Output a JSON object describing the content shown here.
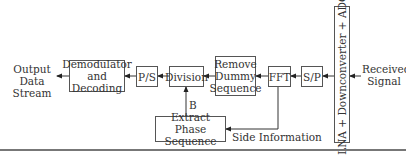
{
  "diagram": {
    "type": "block-diagram",
    "title": "",
    "blocks": {
      "demodulator": "Demodulator and Decoding",
      "ps": "P/S",
      "division": "Division",
      "remove_dummy": "Remove Dummy Sequence",
      "fft": "FFT",
      "sp": "S/P",
      "lna": "LNA + Downconverter + ADC",
      "extract_phase": "Extract Phase Sequence"
    },
    "labels": {
      "output": "Output Data Stream",
      "input": "Received Signal",
      "b": "B",
      "side_info": "Side Information"
    },
    "edges": [
      {
        "from": "Received Signal",
        "to": "LNA + Downconverter + ADC"
      },
      {
        "from": "LNA + Downconverter + ADC",
        "to": "S/P"
      },
      {
        "from": "S/P",
        "to": "FFT"
      },
      {
        "from": "FFT",
        "to": "Remove Dummy Sequence"
      },
      {
        "from": "FFT",
        "to": "Extract Phase Sequence",
        "label": "Side Information"
      },
      {
        "from": "Remove Dummy Sequence",
        "to": "Division"
      },
      {
        "from": "Extract Phase Sequence",
        "to": "Division",
        "label": "B"
      },
      {
        "from": "Division",
        "to": "P/S"
      },
      {
        "from": "P/S",
        "to": "Demodulator and Decoding"
      },
      {
        "from": "Demodulator and Decoding",
        "to": "Output Data Stream"
      }
    ]
  }
}
